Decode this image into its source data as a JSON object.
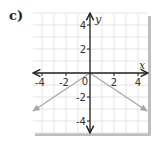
{
  "part_label": "c)",
  "chart_data": {
    "type": "line",
    "title": "",
    "xlabel": "x",
    "ylabel": "y",
    "xlim": [
      -4.75,
      4.75
    ],
    "ylim": [
      -5,
      5
    ],
    "grid": true,
    "x_ticks": [
      -4,
      -2,
      2,
      4
    ],
    "y_ticks": [
      4,
      2,
      -2,
      -4
    ],
    "origin_label": "0",
    "series": [
      {
        "name": "y = -(2/3)|x|",
        "color": "#a8a8a8",
        "points": [
          [
            -4.75,
            -3.17
          ],
          [
            0,
            0
          ],
          [
            4.75,
            -3.17
          ]
        ],
        "arrows_at_ends": true
      }
    ],
    "colors": {
      "axis": "#222222",
      "grid": "#e4e4e4",
      "frame_shadow": "#bdbdbd"
    }
  }
}
